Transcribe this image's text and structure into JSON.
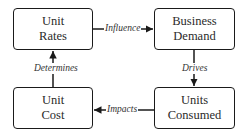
{
  "nodes": [
    {
      "id": "unit-rates",
      "line1": "Unit",
      "line2": "Rates"
    },
    {
      "id": "business-demand",
      "line1": "Business",
      "line2": "Demand"
    },
    {
      "id": "unit-cost",
      "line1": "Unit",
      "line2": "Cost"
    },
    {
      "id": "units-consumed",
      "line1": "Units",
      "line2": "Consumed"
    }
  ],
  "edges": [
    {
      "from": "Unit Rates",
      "to": "Business Demand",
      "label": "Influence"
    },
    {
      "from": "Business Demand",
      "to": "Units Consumed",
      "label": "Drives"
    },
    {
      "from": "Units Consumed",
      "to": "Unit Cost",
      "label": "Impacts"
    },
    {
      "from": "Unit Cost",
      "to": "Unit Rates",
      "label": "Determines"
    }
  ],
  "colors": {
    "stroke": "#1a1a1a",
    "text": "#2a2a2a",
    "background": "#ffffff"
  }
}
